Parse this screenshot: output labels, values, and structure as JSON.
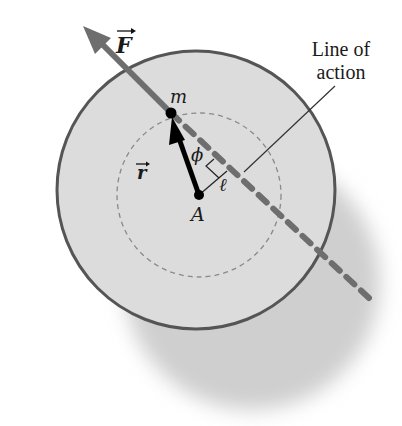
{
  "diagram": {
    "labels": {
      "force": "F",
      "mass": "m",
      "position_vector": "r",
      "angle": "ϕ",
      "lever_arm": "ℓ",
      "pivot": "A",
      "line_of_action_line1": "Line of",
      "line_of_action_line2": "action"
    },
    "colors": {
      "disc_fill": "#dcdcdc",
      "disc_outline": "#555555",
      "force_line": "#6e6e6e",
      "shadow": "#cfcfcf",
      "vector_r": "#000000",
      "dashed_circle": "#8a8a8a",
      "text": "#1a1a1a"
    },
    "geometry": {
      "disc": {
        "cx": 196,
        "cy": 190,
        "r": 139
      },
      "inner_dashed_circle": {
        "cx": 199,
        "cy": 195,
        "r": 82
      },
      "shadow": {
        "cx": 252,
        "cy": 282,
        "r": 128
      },
      "point_m": {
        "x": 171,
        "y": 113
      },
      "point_A": {
        "x": 199,
        "y": 195
      },
      "force_arrow_tip": {
        "x": 83,
        "y": 26
      },
      "line_of_action_end": {
        "x": 370,
        "y": 299
      },
      "perpendicular_foot": {
        "x": 227,
        "y": 171
      },
      "leader_start": {
        "x": 335,
        "y": 86
      },
      "leader_end": {
        "x": 244,
        "y": 172
      }
    }
  }
}
